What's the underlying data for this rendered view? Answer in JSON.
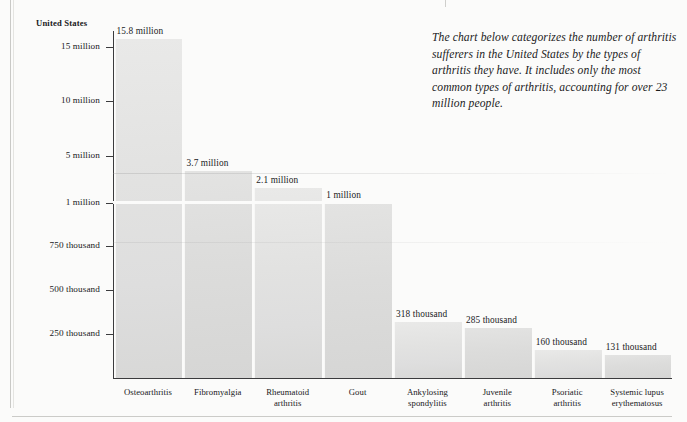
{
  "note": {
    "text": "The chart below categorizes the number of arthritis sufferers in the United States by the types of arthritis they have. It includes only the most common types of arthritis, accounting for over 23 million people."
  },
  "axis_caption": "United States",
  "chart_data": {
    "type": "bar",
    "title": "",
    "subtitle": "",
    "xlabel": "",
    "ylabel": "United States",
    "grid": false,
    "legend": null,
    "broken_axis": true,
    "axis_note": "Y-axis uses a broken dual scale: 0 to 1 million in the lower band, 1 million to 15 million in the upper band.",
    "categories": [
      "Osteoarthritis",
      "Fibromyalgia",
      "Rheumatoid arthritis",
      "Gout",
      "Ankylosing spondylitis",
      "Juvenile arthritis",
      "Psoriatic arthritis",
      "Systemic lupus erythematosus"
    ],
    "category_lines": [
      [
        "Osteoarthritis"
      ],
      [
        "Fibromyalgia"
      ],
      [
        "Rheumatoid",
        "arthritis"
      ],
      [
        "Gout"
      ],
      [
        "Ankylosing",
        "spondylitis"
      ],
      [
        "Juvenile",
        "arthritis"
      ],
      [
        "Psoriatic",
        "arthritis"
      ],
      [
        "Systemic lupus",
        "erythematosus"
      ]
    ],
    "values": [
      15800000,
      3700000,
      2100000,
      1000000,
      318000,
      285000,
      160000,
      131000
    ],
    "value_labels": [
      "15.8 million",
      "3.7 million",
      "2.1 million",
      "1 million",
      "318 thousand",
      "285 thousand",
      "160 thousand",
      "131 thousand"
    ],
    "ytick_labels": [
      "15 million",
      "10 million",
      "5 million",
      "1 million",
      "750 thousand",
      "500 thousand",
      "250 thousand"
    ],
    "ytick_values": [
      15000000,
      10000000,
      5000000,
      1000000,
      750000,
      500000,
      250000
    ],
    "ylim": [
      0,
      16500000
    ],
    "bar_color": "#e0e0df",
    "axis_color": "#3b3b3d",
    "text_color": "#19191b",
    "background": "#fbfbfa"
  }
}
